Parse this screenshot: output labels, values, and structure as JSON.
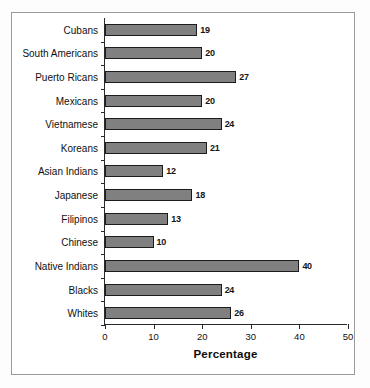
{
  "chart_data": {
    "type": "bar",
    "orientation": "horizontal",
    "title": "",
    "xlabel": "Percentage",
    "ylabel": "",
    "xlim": [
      0,
      50
    ],
    "xticks": [
      0,
      10,
      20,
      30,
      40,
      50
    ],
    "grid": false,
    "legend": null,
    "bar_color": "#808080",
    "bar_edge_color": "#1c1c1c",
    "categories": [
      "Cubans",
      "South Americans",
      "Puerto Ricans",
      "Mexicans",
      "Vietnamese",
      "Koreans",
      "Asian Indians",
      "Japanese",
      "Filipinos",
      "Chinese",
      "Native Indians",
      "Blacks",
      "Whites"
    ],
    "values": [
      19,
      20,
      27,
      20,
      24,
      21,
      12,
      18,
      13,
      10,
      40,
      24,
      26
    ],
    "data_labels": [
      "19",
      "20",
      "27",
      "20",
      "24",
      "21",
      "12",
      "18",
      "13",
      "10",
      "40",
      "24",
      "26"
    ],
    "tick_labels": [
      "0",
      "10",
      "20",
      "30",
      "40",
      "50"
    ]
  }
}
